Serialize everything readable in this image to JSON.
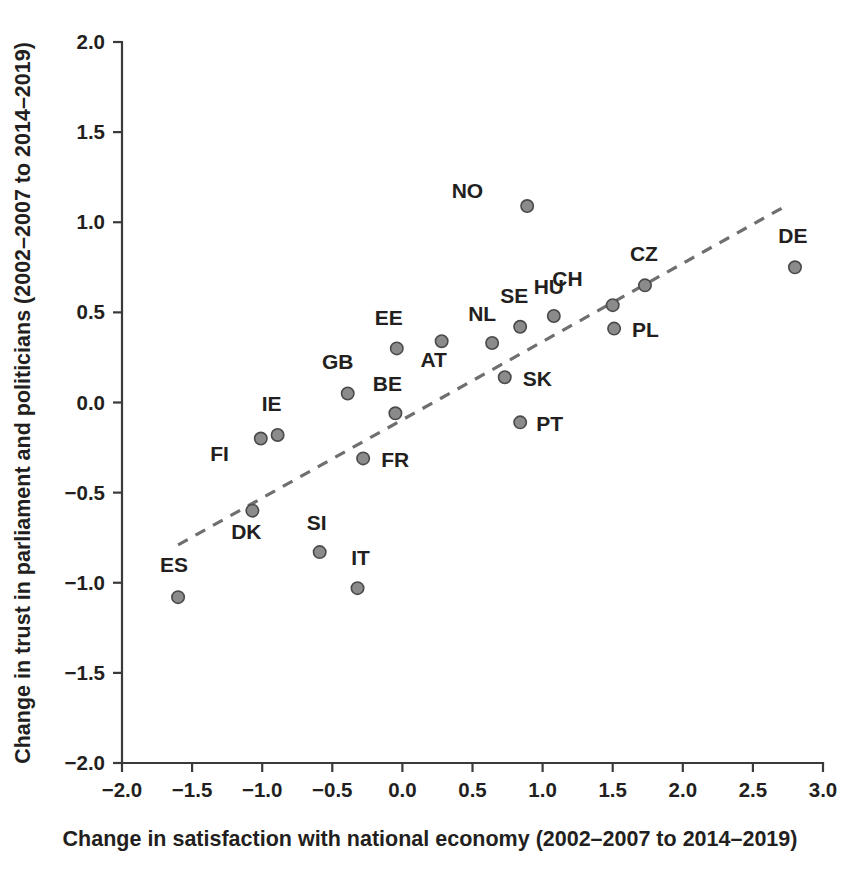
{
  "chart_data": {
    "type": "scatter",
    "title": "",
    "xlabel": "Change in satisfaction with national economy (2002–2007 to 2014–2019)",
    "ylabel": "Change in trust in parliament and politicians (2002–2007 to 2014–2019)",
    "xlim": [
      -2.0,
      3.0
    ],
    "ylim": [
      -2.0,
      2.0
    ],
    "grid": false,
    "legend": "none",
    "xticks": [
      "-2.0",
      "-1.5",
      "-1.0",
      "-0.5",
      "0.0",
      "0.5",
      "1.0",
      "1.5",
      "2.0",
      "2.5",
      "3.0"
    ],
    "xtick_values": [
      -2.0,
      -1.5,
      -1.0,
      -0.5,
      0.0,
      0.5,
      1.0,
      1.5,
      2.0,
      2.5,
      3.0
    ],
    "yticks": [
      "2.0",
      "1.5",
      "1.0",
      "0.5",
      "0.0",
      "-0.5",
      "-1.0",
      "-1.5",
      "-2.0"
    ],
    "ytick_values": [
      2.0,
      1.5,
      1.0,
      0.5,
      0.0,
      -0.5,
      -1.0,
      -1.5,
      -2.0
    ],
    "marker_color": "#8b8b8b",
    "marker_edge_color": "#4a4a4a",
    "trendline": {
      "style": "dashed",
      "color": "#6f6f6f",
      "x_start": -1.6,
      "y_start": -0.79,
      "x_end": 2.71,
      "y_end": 1.08
    },
    "points": [
      {
        "label": "NO",
        "x": 0.89,
        "y": 1.09,
        "label_dx": -44,
        "label_dy": -8
      },
      {
        "label": "DE",
        "x": 2.8,
        "y": 0.75,
        "label_dx": -2,
        "label_dy": -24
      },
      {
        "label": "CZ",
        "x": 1.73,
        "y": 0.65,
        "label_dx": -1,
        "label_dy": -24
      },
      {
        "label": "CH",
        "x": 1.5,
        "y": 0.54,
        "label_dx": -30,
        "label_dy": -19
      },
      {
        "label": "HU",
        "x": 1.08,
        "y": 0.48,
        "label_dx": -5,
        "label_dy": -22
      },
      {
        "label": "SE",
        "x": 0.84,
        "y": 0.42,
        "label_dx": -6,
        "label_dy": -24
      },
      {
        "label": "PL",
        "x": 1.51,
        "y": 0.41,
        "label_dx": 18,
        "label_dy": 8
      },
      {
        "label": "AT",
        "x": 0.28,
        "y": 0.34,
        "label_dx": -8,
        "label_dy": 26
      },
      {
        "label": "NL",
        "x": 0.64,
        "y": 0.33,
        "label_dx": -10,
        "label_dy": -22
      },
      {
        "label": "EE",
        "x": -0.04,
        "y": 0.3,
        "label_dx": -8,
        "label_dy": -23
      },
      {
        "label": "SK",
        "x": 0.73,
        "y": 0.14,
        "label_dx": 18,
        "label_dy": 9
      },
      {
        "label": "GB",
        "x": -0.39,
        "y": 0.05,
        "label_dx": -10,
        "label_dy": -24
      },
      {
        "label": "BE",
        "x": -0.05,
        "y": -0.06,
        "label_dx": -8,
        "label_dy": -22
      },
      {
        "label": "IE",
        "x": -0.89,
        "y": -0.18,
        "label_dx": -6,
        "label_dy": -24
      },
      {
        "label": "FI",
        "x": -1.01,
        "y": -0.2,
        "label_dx": -32,
        "label_dy": 22
      },
      {
        "label": "PT",
        "x": 0.84,
        "y": -0.11,
        "label_dx": 16,
        "label_dy": 9
      },
      {
        "label": "FR",
        "x": -0.28,
        "y": -0.31,
        "label_dx": 18,
        "label_dy": 9
      },
      {
        "label": "DK",
        "x": -1.07,
        "y": -0.6,
        "label_dx": -6,
        "label_dy": 28
      },
      {
        "label": "SI",
        "x": -0.59,
        "y": -0.83,
        "label_dx": -3,
        "label_dy": -22
      },
      {
        "label": "IT",
        "x": -0.32,
        "y": -1.03,
        "label_dx": 3,
        "label_dy": -23
      },
      {
        "label": "ES",
        "x": -1.6,
        "y": -1.08,
        "label_dx": -4,
        "label_dy": -25
      }
    ]
  }
}
